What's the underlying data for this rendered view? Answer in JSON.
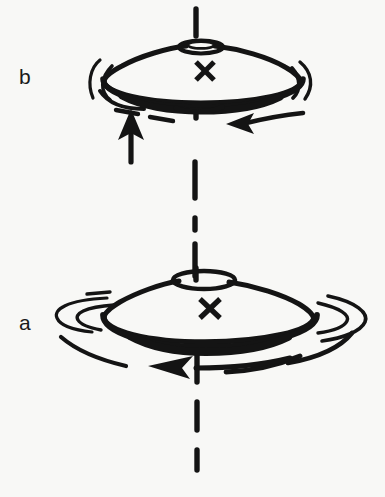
{
  "figure": {
    "kind": "line-drawing",
    "background_color": "#f8f8f6",
    "ink_color": "#141414",
    "width": 385,
    "height": 497,
    "panels": [
      {
        "id": "b",
        "label": "b",
        "label_x": 27,
        "label_y": 80,
        "top_center_x": 198,
        "top_center_y": 75,
        "center_mark": "X",
        "center_mark_x": 205,
        "center_mark_y": 71,
        "arrows": [
          {
            "name": "upward-force-arrow",
            "direction": "up",
            "label": ""
          },
          {
            "name": "leftward-force-arrow",
            "direction": "left",
            "label": ""
          }
        ],
        "rotation_arcs": 6
      },
      {
        "id": "a",
        "label": "a",
        "label_x": 27,
        "label_y": 326,
        "top_center_x": 203,
        "top_center_y": 310,
        "center_mark": "X",
        "center_mark_x": 210,
        "center_mark_y": 308,
        "arrows": [
          {
            "name": "rotation-direction-arrow",
            "direction": "left",
            "label": ""
          }
        ],
        "rotation_arcs": 6
      }
    ],
    "axis": {
      "name": "vertical-spin-axis",
      "style": "dash-dot",
      "x": 196,
      "y_top": 8,
      "y_bottom": 470
    }
  }
}
